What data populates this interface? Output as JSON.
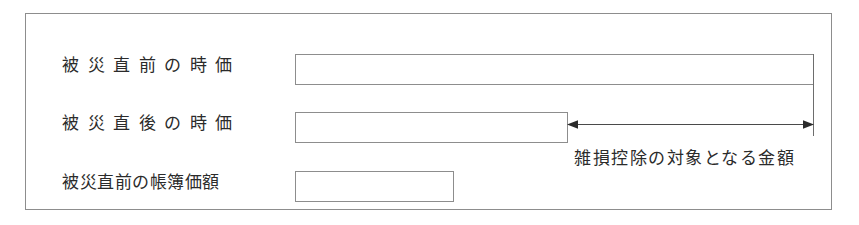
{
  "diagram": {
    "frame_color": "#8d8d8d",
    "line_color": "#6d6d6d",
    "text_color": "#2b2b2b",
    "rows": [
      {
        "label": "被災直前の時価",
        "bar_name": "market-value-before-disaster"
      },
      {
        "label": "被災直後の時価",
        "bar_name": "market-value-after-disaster"
      },
      {
        "label": "被災直前の帳簿価額",
        "bar_name": "book-value-before-disaster"
      }
    ],
    "annotation": {
      "text": "雑損控除の対象となる金額",
      "arrow": "double-headed-horizontal-arrow"
    }
  }
}
